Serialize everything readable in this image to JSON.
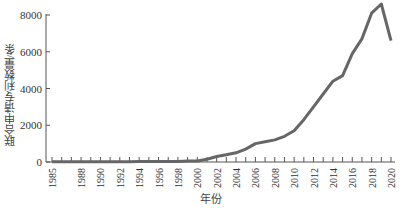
{
  "chart_data": {
    "type": "line",
    "title": "",
    "xlabel": "年份",
    "ylabel": "联合申请专利数量/条",
    "ylim": [
      0,
      8000
    ],
    "yticks": [
      0,
      2000,
      4000,
      6000,
      8000
    ],
    "xtick_labels": [
      "1985",
      "1988",
      "1990",
      "1992",
      "1994",
      "1996",
      "1998",
      "2000",
      "2002",
      "2004",
      "2006",
      "2008",
      "2010",
      "2012",
      "2014",
      "2016",
      "2018",
      "2020"
    ],
    "grid": false,
    "legend": null,
    "series": [
      {
        "name": "联合申请专利数量",
        "color": "#666666",
        "x": [
          1985,
          1986,
          1987,
          1988,
          1989,
          1990,
          1991,
          1992,
          1993,
          1994,
          1995,
          1996,
          1997,
          1998,
          1999,
          2000,
          2001,
          2002,
          2003,
          2004,
          2005,
          2006,
          2007,
          2008,
          2009,
          2010,
          2011,
          2012,
          2013,
          2014,
          2015,
          2016,
          2017,
          2018,
          2019,
          2020
        ],
        "values": [
          10,
          10,
          10,
          10,
          10,
          10,
          10,
          15,
          15,
          20,
          20,
          25,
          30,
          35,
          50,
          60,
          150,
          300,
          400,
          500,
          700,
          1000,
          1100,
          1200,
          1400,
          1700,
          2300,
          3000,
          3700,
          4400,
          4700,
          5900,
          6700,
          8100,
          8600,
          6600
        ]
      }
    ]
  }
}
